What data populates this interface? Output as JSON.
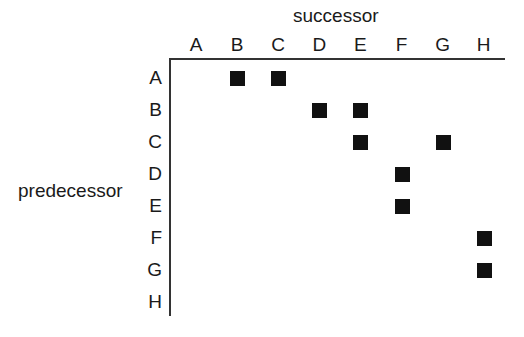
{
  "labels": {
    "x_axis": "successor",
    "y_axis": "predecessor"
  },
  "columns": [
    "A",
    "B",
    "C",
    "D",
    "E",
    "F",
    "G",
    "H"
  ],
  "rows": [
    "A",
    "B",
    "C",
    "D",
    "E",
    "F",
    "G",
    "H"
  ],
  "edges": [
    [
      "A",
      "B"
    ],
    [
      "A",
      "C"
    ],
    [
      "B",
      "D"
    ],
    [
      "B",
      "E"
    ],
    [
      "C",
      "E"
    ],
    [
      "C",
      "G"
    ],
    [
      "D",
      "F"
    ],
    [
      "E",
      "F"
    ],
    [
      "F",
      "H"
    ],
    [
      "G",
      "H"
    ]
  ],
  "mark_color": "#111111"
}
